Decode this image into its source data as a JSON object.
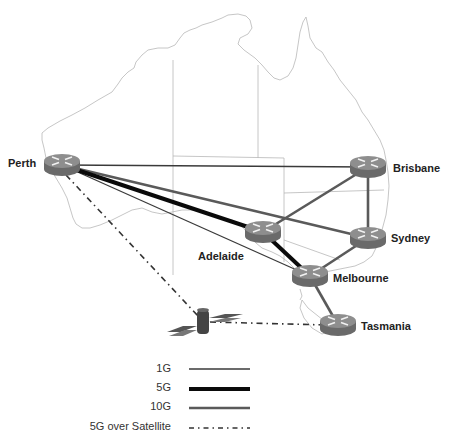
{
  "colors": {
    "map_outline": "#b8b8b8",
    "link_1g": "#3a3a3a",
    "link_5g": "#0a0a0a",
    "link_10g": "#5a5a5a",
    "link_satellite": "#333333",
    "router_top": "#8e8e8e",
    "router_side": "#6a6a6a",
    "label": "#222222"
  },
  "nodes": [
    {
      "id": "perth",
      "label": "Perth",
      "type": "router",
      "x": 62,
      "y": 165
    },
    {
      "id": "brisbane",
      "label": "Brisbane",
      "type": "router",
      "x": 368,
      "y": 167
    },
    {
      "id": "adelaide",
      "label": "Adelaide",
      "type": "router",
      "x": 263,
      "y": 232
    },
    {
      "id": "sydney",
      "label": "Sydney",
      "type": "router",
      "x": 368,
      "y": 238
    },
    {
      "id": "melbourne",
      "label": "Melbourne",
      "type": "router",
      "x": 310,
      "y": 276
    },
    {
      "id": "tasmania",
      "label": "Tasmania",
      "type": "router",
      "x": 338,
      "y": 325
    },
    {
      "id": "satellite",
      "label": "",
      "type": "satellite",
      "x": 203,
      "y": 322
    }
  ],
  "links": [
    {
      "from": "perth",
      "to": "brisbane",
      "type": "1G"
    },
    {
      "from": "perth",
      "to": "melbourne",
      "type": "1G"
    },
    {
      "from": "perth",
      "to": "adelaide",
      "type": "5G"
    },
    {
      "from": "adelaide",
      "to": "melbourne",
      "type": "5G"
    },
    {
      "from": "perth",
      "to": "sydney",
      "type": "10G"
    },
    {
      "from": "adelaide",
      "to": "brisbane",
      "type": "10G"
    },
    {
      "from": "brisbane",
      "to": "sydney",
      "type": "10G"
    },
    {
      "from": "sydney",
      "to": "melbourne",
      "type": "10G"
    },
    {
      "from": "melbourne",
      "to": "tasmania",
      "type": "10G"
    },
    {
      "from": "perth",
      "to": "satellite",
      "type": "5G over Satellite"
    },
    {
      "from": "satellite",
      "to": "tasmania",
      "type": "5G over Satellite"
    }
  ],
  "labels": {
    "perth": "Perth",
    "brisbane": "Brisbane",
    "adelaide": "Adelaide",
    "sydney": "Sydney",
    "melbourne": "Melbourne",
    "tasmania": "Tasmania"
  },
  "legend": {
    "items": [
      {
        "label": "1G",
        "style": "thin"
      },
      {
        "label": "5G",
        "style": "thick"
      },
      {
        "label": "10G",
        "style": "medium-gray"
      },
      {
        "label": "5G over Satellite",
        "style": "dash-dot"
      }
    ]
  }
}
